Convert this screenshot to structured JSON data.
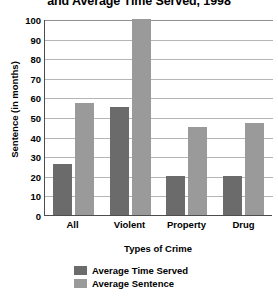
{
  "chart_data": {
    "type": "bar",
    "title": "and Average Time Served, 1998",
    "xlabel": "Types of Crime",
    "ylabel": "Sentence (in months)",
    "categories": [
      "All",
      "Violent",
      "Property",
      "Drug"
    ],
    "series": [
      {
        "name": "Average Time Served",
        "color": "#6b6b6b",
        "values": [
          26,
          55,
          20,
          20
        ]
      },
      {
        "name": "Average Sentence",
        "color": "#9a9a9a",
        "values": [
          57,
          100,
          45,
          47
        ]
      }
    ],
    "ylim": [
      0,
      100
    ],
    "yticks": [
      100,
      90,
      80,
      70,
      60,
      50,
      40,
      30,
      20,
      10,
      0
    ],
    "grid": true,
    "legend_position": "bottom-center"
  }
}
